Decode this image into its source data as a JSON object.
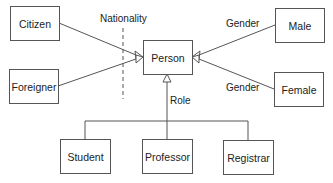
{
  "diagram": {
    "type": "UML generalization diagram",
    "central_class": {
      "id": "person",
      "label": "Person"
    },
    "classes": [
      {
        "id": "citizen",
        "label": "Citizen"
      },
      {
        "id": "foreigner",
        "label": "Foreigner"
      },
      {
        "id": "person",
        "label": "Person"
      },
      {
        "id": "male",
        "label": "Male"
      },
      {
        "id": "female",
        "label": "Female"
      },
      {
        "id": "student",
        "label": "Student"
      },
      {
        "id": "professor",
        "label": "Professor"
      },
      {
        "id": "registrar",
        "label": "Registrar"
      }
    ],
    "discriminators": {
      "nationality": "Nationality",
      "gender_top": "Gender",
      "gender_bottom": "Gender",
      "role": "Role"
    },
    "generalizations": [
      {
        "child": "Citizen",
        "parent": "Person",
        "discriminator": "Nationality"
      },
      {
        "child": "Foreigner",
        "parent": "Person",
        "discriminator": "Nationality"
      },
      {
        "child": "Male",
        "parent": "Person",
        "discriminator": "Gender"
      },
      {
        "child": "Female",
        "parent": "Person",
        "discriminator": "Gender"
      },
      {
        "child": "Student",
        "parent": "Person",
        "discriminator": "Role"
      },
      {
        "child": "Professor",
        "parent": "Person",
        "discriminator": "Role"
      },
      {
        "child": "Registrar",
        "parent": "Person",
        "discriminator": "Role"
      }
    ],
    "colors": {
      "line": "#555555",
      "text": "#222222",
      "background": "#ffffff"
    }
  }
}
